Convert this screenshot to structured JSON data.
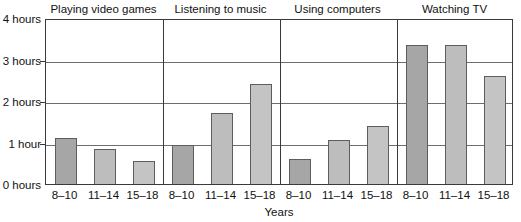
{
  "chart_data": {
    "type": "bar",
    "title": "",
    "xlabel": "Years",
    "ylabel": "",
    "ylim": [
      0,
      4
    ],
    "grid": true,
    "legend_position": "none",
    "y_ticks": [
      {
        "value": 0,
        "label": "0 hours"
      },
      {
        "value": 1,
        "label": "1 hour"
      },
      {
        "value": 2,
        "label": "2 hours"
      },
      {
        "value": 3,
        "label": "3 hours"
      },
      {
        "value": 4,
        "label": "4 hours"
      }
    ],
    "categories": [
      "8–10",
      "11–14",
      "15–18"
    ],
    "panels": [
      {
        "title": "Playing video games",
        "bars": [
          {
            "category": "8–10",
            "value": 1.1,
            "color": "#a6a6a6"
          },
          {
            "category": "11–14",
            "value": 0.85,
            "color": "#bdbdbd"
          },
          {
            "category": "15–18",
            "value": 0.55,
            "color": "#c4c4c4"
          }
        ]
      },
      {
        "title": "Listening to music",
        "bars": [
          {
            "category": "8–10",
            "value": 0.95,
            "color": "#a6a6a6"
          },
          {
            "category": "11–14",
            "value": 1.7,
            "color": "#bdbdbd"
          },
          {
            "category": "15–18",
            "value": 2.4,
            "color": "#c4c4c4"
          }
        ]
      },
      {
        "title": "Using computers",
        "bars": [
          {
            "category": "8–10",
            "value": 0.6,
            "color": "#a6a6a6"
          },
          {
            "category": "11–14",
            "value": 1.05,
            "color": "#bdbdbd"
          },
          {
            "category": "15–18",
            "value": 1.4,
            "color": "#c4c4c4"
          }
        ]
      },
      {
        "title": "Watching TV",
        "bars": [
          {
            "category": "8–10",
            "value": 3.35,
            "color": "#a6a6a6"
          },
          {
            "category": "11–14",
            "value": 3.35,
            "color": "#bdbdbd"
          },
          {
            "category": "15–18",
            "value": 2.6,
            "color": "#c4c4c4"
          }
        ]
      }
    ],
    "colors": {
      "axis": "#3a3a3a",
      "grid": "#6d6d6d",
      "bar_outline": "#5d5d5d",
      "text": "#111111",
      "background": "#ffffff"
    }
  }
}
